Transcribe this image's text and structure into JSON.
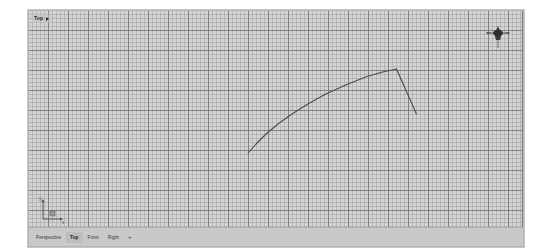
{
  "viewport": {
    "label": "Top",
    "label_caret_icon": "chevron-right-icon",
    "background_color": "#d4d4d4",
    "grid_major_color": "#787878",
    "grid_minor_color": "#a0a0a0",
    "grid_major_spacing_px": 20,
    "grid_minor_spacing_px": 4,
    "curve_color": "#4a4a4a",
    "viewcube_icon": "view-cube-gizmo-icon",
    "axis_tripod": {
      "icon": "axis-tripod-icon",
      "y_label": "y",
      "x_label": "x"
    }
  },
  "view_tabs": {
    "items": [
      {
        "label": "Perspective",
        "active": false
      },
      {
        "label": "Top",
        "active": true
      },
      {
        "label": "Front",
        "active": false
      },
      {
        "label": "Right",
        "active": false
      }
    ],
    "add_label": "+"
  },
  "chart_data": {
    "type": "line",
    "title": "",
    "xlabel": "",
    "ylabel": "",
    "grid": true,
    "legend": "none",
    "series": [
      {
        "name": "profile-curve",
        "color": "#4a4a4a",
        "points": [
          [
            248,
            152
          ],
          [
            256,
            143
          ],
          [
            266,
            133
          ],
          [
            278,
            123
          ],
          [
            292,
            113
          ],
          [
            308,
            103
          ],
          [
            326,
            93
          ],
          [
            346,
            84
          ],
          [
            366,
            76
          ],
          [
            383,
            71
          ],
          [
            397,
            68
          ]
        ]
      },
      {
        "name": "tail-segment",
        "color": "#4a4a4a",
        "points": [
          [
            397,
            68
          ],
          [
            417,
            113
          ]
        ]
      }
    ],
    "xlim": [
      28,
      524
    ],
    "ylim": [
      10,
      228
    ]
  }
}
